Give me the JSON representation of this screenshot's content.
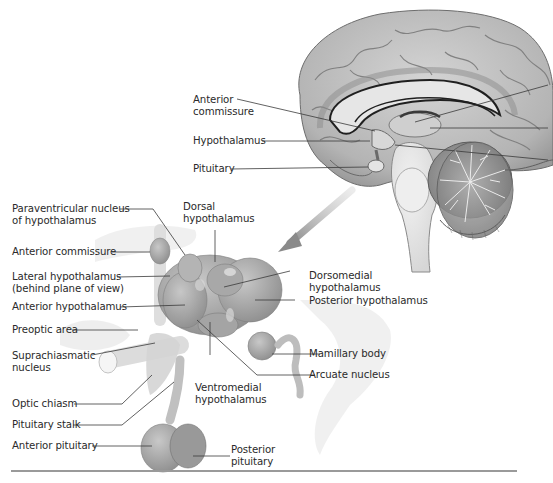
{
  "figure": {
    "type": "anatomical-diagram",
    "colors": {
      "background": "#ffffff",
      "brain_gray": "#bdbdbd",
      "brain_dark": "#8c8c8c",
      "brain_light": "#e0e0e0",
      "hypothalamus_gray": "#9e9e9e",
      "arrow_gray": "#8a8a8a",
      "leader_line": "#3a3a3a",
      "label_text": "#2a2a2a",
      "rule": "#9a9a9a"
    }
  },
  "brain_labels": {
    "anterior_commissure_line1": "Anterior",
    "anterior_commissure_line2": "commissure",
    "hypothalamus": "Hypothalamus",
    "pituitary": "Pituitary"
  },
  "detail_labels": {
    "paraventricular_line1": "Paraventricular nucleus",
    "paraventricular_line2": "of hypothalamus",
    "dorsal_line1": "Dorsal",
    "dorsal_line2": "hypothalamus",
    "anterior_commissure": "Anterior commissure",
    "lateral_line1": "Lateral hypothalamus",
    "lateral_line2": "(behind plane of view)",
    "dorsomedial_line1": "Dorsomedial",
    "dorsomedial_line2": "hypothalamus",
    "anterior_hypothalamus": "Anterior hypothalamus",
    "posterior_hypothalamus": "Posterior hypothalamus",
    "preoptic_area": "Preoptic area",
    "suprachiasmatic_line1": "Suprachiasmatic",
    "suprachiasmatic_line2": "nucleus",
    "mamillary_body": "Mamillary body",
    "ventromedial_line1": "Ventromedial",
    "ventromedial_line2": "hypothalamus",
    "optic_chiasm": "Optic chiasm",
    "arcuate_nucleus": "Arcuate nucleus",
    "pituitary_stalk": "Pituitary stalk",
    "anterior_pituitary": "Anterior pituitary",
    "posterior_pituitary_line1": "Posterior",
    "posterior_pituitary_line2": "pituitary"
  }
}
